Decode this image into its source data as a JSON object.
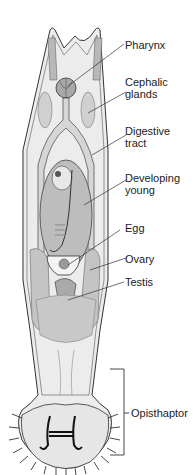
{
  "diagram": {
    "labels": [
      {
        "id": "pharynx",
        "text": "Pharynx"
      },
      {
        "id": "cephalic-glands",
        "line1": "Cephalic",
        "line2": "glands"
      },
      {
        "id": "digestive-tract",
        "line1": "Digestive",
        "line2": "tract"
      },
      {
        "id": "developing-young",
        "line1": "Developing",
        "line2": "young"
      },
      {
        "id": "egg",
        "text": "Egg"
      },
      {
        "id": "ovary",
        "text": "Ovary"
      },
      {
        "id": "testis",
        "text": "Testis"
      },
      {
        "id": "opisthaptor",
        "text": "Opisthaptor"
      }
    ],
    "colors": {
      "outline": "#333333",
      "body_fill": "#ececec",
      "gut_fill": "#d6d6d6",
      "young_fill": "#bdbdbd",
      "gonad_fill": "#c4c4c4",
      "haptor_fill": "#e6e6e6"
    }
  }
}
